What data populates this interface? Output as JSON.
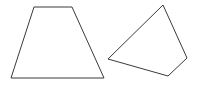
{
  "canvas": {
    "width": 203,
    "height": 85,
    "background_color": "#ffffff"
  },
  "figure": {
    "stroke_color": "#3a3a3a",
    "stroke_width": 1,
    "fill": "none",
    "shape_count": 2
  },
  "shapes": [
    {
      "name": "trapezoid",
      "label": "isosceles trapezoid",
      "position": "left",
      "sides": 4,
      "points": "34,7 72,7 104,78 11,78",
      "vertices": [
        {
          "name": "top-left",
          "x": 34,
          "y": 7
        },
        {
          "name": "top-right",
          "x": 72,
          "y": 7
        },
        {
          "name": "bottom-right",
          "x": 104,
          "y": 78
        },
        {
          "name": "bottom-left",
          "x": 11,
          "y": 78
        }
      ]
    },
    {
      "name": "quadrilateral",
      "label": "irregular convex quadrilateral",
      "position": "right",
      "sides": 4,
      "points": "163,5 187,58 168,76 108,59",
      "vertices": [
        {
          "name": "top",
          "x": 163,
          "y": 5
        },
        {
          "name": "right",
          "x": 187,
          "y": 58
        },
        {
          "name": "bottom",
          "x": 168,
          "y": 76
        },
        {
          "name": "left",
          "x": 108,
          "y": 59
        }
      ]
    }
  ]
}
